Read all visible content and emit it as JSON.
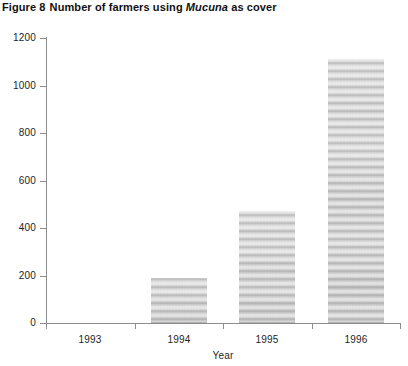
{
  "figure": {
    "label": "Figure 8",
    "title_before": "Number of farmers using",
    "title_italic": "Mucuna",
    "title_after": "as cover"
  },
  "chart_data": {
    "type": "bar",
    "xlabel": "Year",
    "ylabel": "",
    "categories": [
      "1993",
      "1994",
      "1995",
      "1996"
    ],
    "values": [
      0,
      190,
      470,
      1110
    ],
    "ylim": [
      0,
      1200
    ],
    "yticks": [
      0,
      200,
      400,
      600,
      800,
      1000,
      1200
    ],
    "ytick_labels": [
      "0",
      "200",
      "400",
      "600",
      "800",
      "1000",
      "1200"
    ],
    "grid": false,
    "legend": null,
    "bar_color": "#c9c9c9",
    "axis_color": "#8d8d8d",
    "text_color": "#1e1e1e"
  }
}
